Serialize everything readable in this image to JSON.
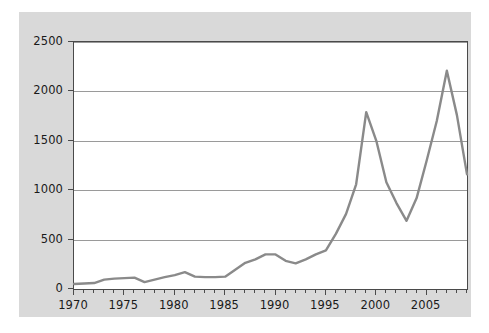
{
  "chart_data": {
    "type": "line",
    "title": "",
    "xlabel": "",
    "ylabel": "Billions of Dollars",
    "xlim": [
      1970,
      2009
    ],
    "ylim": [
      0,
      2500
    ],
    "yticks": [
      0,
      500,
      1000,
      1500,
      2000,
      2500
    ],
    "ytick_labels": [
      "0",
      "500",
      "1000",
      "1500",
      "2000",
      "2500"
    ],
    "xticks": [
      1970,
      1975,
      1980,
      1985,
      1990,
      1995,
      2000,
      2005
    ],
    "xtick_labels": [
      "1970",
      "1975",
      "1980",
      "1985",
      "1990",
      "1995",
      "2000",
      "2005"
    ],
    "x_minor_tick_interval": 1,
    "grid": "horizontal",
    "legend": "none",
    "line_color": "#8a8a8a",
    "line_width": 2.4,
    "series": [
      {
        "name": "value",
        "x": [
          1970,
          1971,
          1972,
          1973,
          1974,
          1975,
          1976,
          1977,
          1978,
          1979,
          1980,
          1981,
          1982,
          1983,
          1984,
          1985,
          1986,
          1987,
          1988,
          1989,
          1990,
          1991,
          1992,
          1993,
          1994,
          1995,
          1996,
          1997,
          1998,
          1999,
          2000,
          2001,
          2002,
          2003,
          2004,
          2005,
          2006,
          2007,
          2008,
          2009
        ],
        "values": [
          50,
          55,
          60,
          95,
          105,
          110,
          115,
          70,
          95,
          120,
          140,
          170,
          125,
          120,
          120,
          125,
          195,
          265,
          300,
          350,
          350,
          285,
          260,
          300,
          350,
          390,
          560,
          760,
          1060,
          1790,
          1500,
          1080,
          870,
          690,
          920,
          1300,
          1700,
          2210,
          1760,
          1160
        ]
      }
    ]
  },
  "figure": {
    "background_color": "#d9d9d9",
    "plot_background_color": "#ffffff",
    "border_color": "#4a4a4a",
    "grid_color": "#9a9a9a"
  }
}
